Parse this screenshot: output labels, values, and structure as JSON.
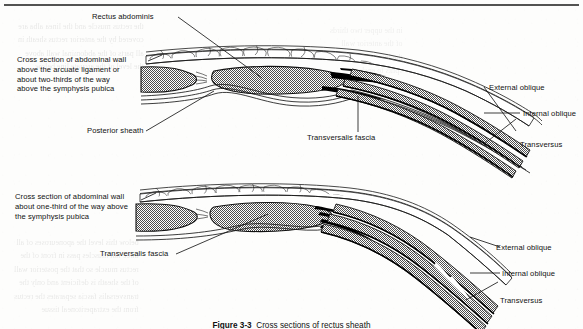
{
  "page": {
    "width": 583,
    "height": 329,
    "background_color": "#fdfdfc",
    "ink_color": "#111111",
    "muscle_fill_color": "#8c8c8c",
    "aponeurosis_color": "#000000",
    "fat_fill_color": "#ffffff",
    "top_rule": "horizontal-rule"
  },
  "figure": {
    "caption_number": "Figure 3-3",
    "caption_text": "Cross sections of rectus sheath",
    "caption_full": "Figure 3-3  Cross sections of rectus sheath"
  },
  "panels": [
    {
      "id": "upper",
      "description_lines": [
        "Cross section of abdominal wall",
        "above the arcuate ligament or",
        "about two-thirds of the way",
        "above the symphysis pubica"
      ],
      "labels": [
        {
          "id": "rectus-abdominis",
          "text": "Rectus abdominis",
          "side": "top"
        },
        {
          "id": "posterior-sheath",
          "text": "Posterior sheath",
          "side": "bottom-left"
        },
        {
          "id": "transversalis-fascia",
          "text": "Transversalis fascia",
          "side": "bottom-center"
        },
        {
          "id": "external-oblique",
          "text": "External oblique",
          "side": "right"
        },
        {
          "id": "internal-oblique",
          "text": "Internal oblique",
          "side": "right"
        },
        {
          "id": "transversus",
          "text": "Transversus",
          "side": "right"
        }
      ]
    },
    {
      "id": "lower",
      "description_lines": [
        "Cross section of abdominal wall",
        "about one-third of the way above",
        "the symphysis pubica"
      ],
      "labels": [
        {
          "id": "transversalis-fascia",
          "text": "Transversalis fascia",
          "side": "left"
        },
        {
          "id": "external-oblique",
          "text": "External oblique",
          "side": "right"
        },
        {
          "id": "internal-oblique",
          "text": "Internal oblique",
          "side": "right"
        },
        {
          "id": "transversus",
          "text": "Transversus",
          "side": "right"
        }
      ]
    }
  ],
  "bleed_through": {
    "note": "faint mirrored text showing through from reverse side of the scanned page",
    "lines_upper": [
      "the rectus muscle and the linea alba are",
      "covered by the anterior rectus sheath in",
      "all parts of the abdominal wall above",
      "the level of the arcuate line below"
    ],
    "lines_lower": [
      "below this level the aponeuroses of all",
      "three flat muscles pass in front of the",
      "rectus muscle so that the posterior wall",
      "of the sheath is deficient and only the",
      "transversalis fascia separates the rectus",
      "from the extraperitoneal tissue"
    ]
  }
}
